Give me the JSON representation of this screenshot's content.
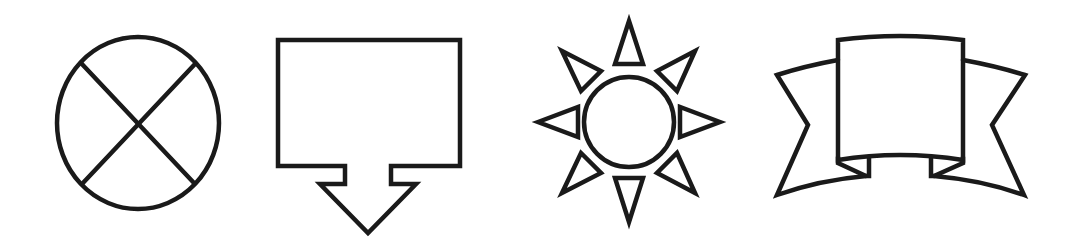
{
  "canvas": {
    "width": 1076,
    "height": 251,
    "background": "#ffffff"
  },
  "style": {
    "stroke": "#1a1a1a",
    "stroke_width": 4.5
  },
  "shapes": [
    {
      "name": "circle-x-icon",
      "label": "Circle with X"
    },
    {
      "name": "arrow-callout-icon",
      "label": "Rectangle callout with down arrow"
    },
    {
      "name": "sun-icon",
      "label": "Sun with triangular rays"
    },
    {
      "name": "banner-ribbon-icon",
      "label": "Ribbon banner"
    }
  ]
}
